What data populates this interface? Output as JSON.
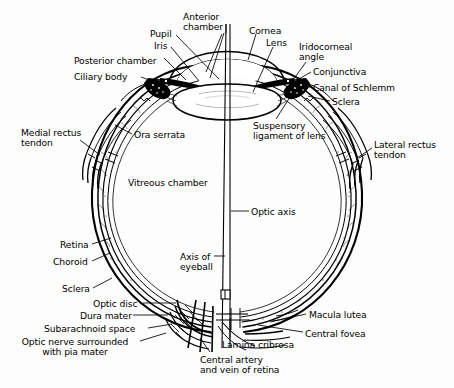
{
  "figure": {
    "type": "anatomical-diagram",
    "background_color": "#fdfdfd",
    "line_color": "#000000",
    "text_color": "#000000",
    "width": 454,
    "height": 388
  },
  "labels": [
    {
      "id": "anterior-chamber",
      "text": "Anterior\nchamber",
      "x": 183,
      "y": 12,
      "align": "left"
    },
    {
      "id": "pupil",
      "text": "Pupil",
      "x": 150,
      "y": 29,
      "align": "left"
    },
    {
      "id": "iris",
      "text": "Iris",
      "x": 154,
      "y": 41,
      "align": "left"
    },
    {
      "id": "cornea",
      "text": "Cornea",
      "x": 249,
      "y": 26,
      "align": "left"
    },
    {
      "id": "lens",
      "text": "Lens",
      "x": 266,
      "y": 38,
      "align": "left"
    },
    {
      "id": "iridocorneal-angle",
      "text": "Iridocorneal\nangle",
      "x": 299,
      "y": 42,
      "align": "left"
    },
    {
      "id": "posterior-chamber",
      "text": "Posterior chamber",
      "x": 74,
      "y": 56,
      "align": "left"
    },
    {
      "id": "conjunctiva",
      "text": "Conjunctiva",
      "x": 313,
      "y": 67,
      "align": "left"
    },
    {
      "id": "ciliary-body",
      "text": "Ciliary body",
      "x": 74,
      "y": 72,
      "align": "left"
    },
    {
      "id": "canal-of-schlemm",
      "text": "Canal of Schlemm",
      "x": 313,
      "y": 83,
      "align": "left"
    },
    {
      "id": "sclera-top-right",
      "text": "Sclera",
      "x": 332,
      "y": 97,
      "align": "left"
    },
    {
      "id": "medial-rectus-tendon",
      "text": "Medial rectus\ntendon",
      "x": 21,
      "y": 128,
      "align": "left"
    },
    {
      "id": "ora-serrata",
      "text": "Ora serrata",
      "x": 134,
      "y": 130,
      "align": "left"
    },
    {
      "id": "suspensory-ligament",
      "text": "Suspensory\nligament of lens",
      "x": 253,
      "y": 121,
      "align": "left"
    },
    {
      "id": "lateral-rectus-tendon",
      "text": "Lateral rectus\ntendon",
      "x": 374,
      "y": 140,
      "align": "left"
    },
    {
      "id": "vitreous-chamber",
      "text": "Vitreous chamber",
      "x": 128,
      "y": 178,
      "align": "left"
    },
    {
      "id": "optic-axis",
      "text": "Optic axis",
      "x": 251,
      "y": 207,
      "align": "left"
    },
    {
      "id": "retina",
      "text": "Retina",
      "x": 60,
      "y": 240,
      "align": "left"
    },
    {
      "id": "axis-of-eyeball",
      "text": "Axis of\neyeball",
      "x": 180,
      "y": 252,
      "align": "left"
    },
    {
      "id": "choroid",
      "text": "Choroid",
      "x": 53,
      "y": 257,
      "align": "left"
    },
    {
      "id": "sclera-lower-left",
      "text": "Sclera",
      "x": 62,
      "y": 284,
      "align": "left"
    },
    {
      "id": "optic-disc",
      "text": "Optic disc",
      "x": 93,
      "y": 299,
      "align": "left"
    },
    {
      "id": "macula-lutea",
      "text": "Macula lutea",
      "x": 309,
      "y": 310,
      "align": "left"
    },
    {
      "id": "dura-mater",
      "text": "Dura mater",
      "x": 80,
      "y": 311,
      "align": "left"
    },
    {
      "id": "subarachnoid-space",
      "text": "Subarachnoid space",
      "x": 44,
      "y": 324,
      "align": "left"
    },
    {
      "id": "central-fovea",
      "text": "Central fovea",
      "x": 305,
      "y": 329,
      "align": "left"
    },
    {
      "id": "lamina-cribrosa",
      "text": "Lamina cribrosa",
      "x": 222,
      "y": 340,
      "align": "left"
    },
    {
      "id": "optic-nerve-pia-mater",
      "text": "Optic nerve surrounded\nwith pia mater",
      "x": 5,
      "y": 337,
      "align": "left"
    },
    {
      "id": "central-artery-vein",
      "text": "Central artery\nand vein of retina",
      "x": 200,
      "y": 355,
      "align": "left"
    }
  ],
  "structures": {
    "globe": "eyeball wall with sclera, choroid and retina layers",
    "lens": "biconvex crystalline lens at anterior pole",
    "cornea": "transparent anterior dome",
    "optic_nerve": "nerve bundle exiting at inferior pole",
    "axes": [
      "optic axis",
      "axis of eyeball"
    ]
  }
}
